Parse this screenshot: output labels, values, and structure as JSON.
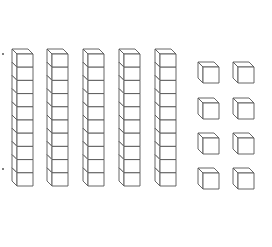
{
  "diagram": {
    "stroke_color": "#555555",
    "fill_color": "#ffffff",
    "tens_rods": {
      "count": 5,
      "cubes_per_rod": 10,
      "x_positions": [
        12,
        47,
        83,
        119,
        155
      ],
      "top_y": 49,
      "cube_width": 16,
      "cube_height": 13.2,
      "depth": 5
    },
    "unit_cubes": {
      "count": 8,
      "columns": [
        198,
        233
      ],
      "rows": [
        62,
        98,
        133,
        168
      ],
      "cube_size": 16,
      "depth": 5
    },
    "markers": [
      {
        "x": 3,
        "y": 54
      },
      {
        "x": 3,
        "y": 169
      }
    ],
    "represented_value": 58
  }
}
